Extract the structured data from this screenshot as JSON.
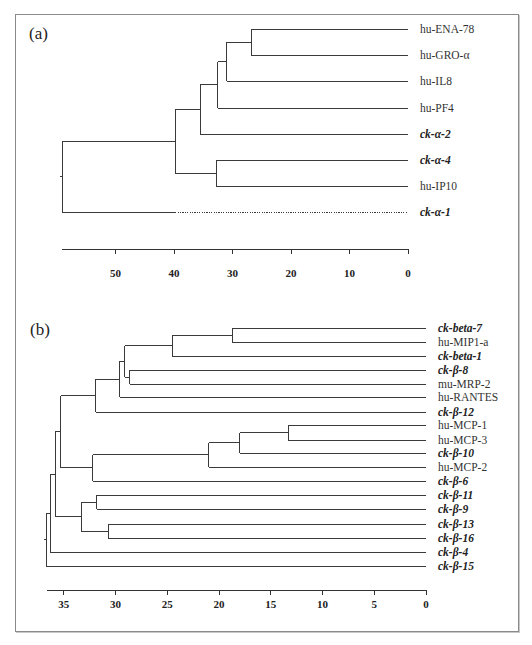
{
  "chart_data": [
    {
      "type": "dendrogram",
      "panel_label": "(a)",
      "xlabel": "",
      "axis": {
        "ticks": [
          50,
          40,
          30,
          20,
          10,
          0
        ],
        "x0_px": 408,
        "px_per_unit": 5.85,
        "y_px": 249,
        "x_start_px": 62
      },
      "leaves": [
        {
          "label": "hu-ENA-78",
          "italic": false,
          "y": 29
        },
        {
          "label": "hu-GRO-α",
          "italic": false,
          "y": 55
        },
        {
          "label": "hu-IL8",
          "italic": false,
          "y": 81
        },
        {
          "label": "hu-PF4",
          "italic": false,
          "y": 108
        },
        {
          "label": "ck-α-2",
          "italic": true,
          "y": 134
        },
        {
          "label": "ck-α-4",
          "italic": true,
          "y": 160
        },
        {
          "label": "hu-IP10",
          "italic": false,
          "y": 186
        },
        {
          "label": "ck-α-1",
          "italic": true,
          "y": 212,
          "dotted_from": 39.8
        }
      ],
      "merges": [
        {
          "id": "n1",
          "children": [
            "hu-ENA-78",
            "hu-GRO-α"
          ],
          "height": 26.8
        },
        {
          "id": "n2",
          "children": [
            "n1",
            "hu-IL8"
          ],
          "height": 31.0
        },
        {
          "id": "n3",
          "children": [
            "n2",
            "hu-PF4"
          ],
          "height": 32.5
        },
        {
          "id": "n4",
          "children": [
            "n3",
            "ck-α-2"
          ],
          "height": 35.5
        },
        {
          "id": "n5",
          "children": [
            "ck-α-4",
            "hu-IP10"
          ],
          "height": 32.8
        },
        {
          "id": "n6",
          "children": [
            "n4",
            "n5"
          ],
          "height": 39.8
        },
        {
          "id": "n7",
          "children": [
            "n6",
            "ck-α-1"
          ],
          "height": 59.1
        }
      ]
    },
    {
      "type": "dendrogram",
      "panel_label": "(b)",
      "xlabel": "",
      "axis": {
        "ticks": [
          35,
          30,
          25,
          20,
          15,
          10,
          5,
          0
        ],
        "x0_px": 426,
        "px_per_unit": 10.35,
        "y_px": 590,
        "x_start_px": 47
      },
      "leaves": [
        {
          "label": "ck-beta-7",
          "italic": true,
          "y": 328
        },
        {
          "label": "hu-MIP1-a",
          "italic": false,
          "y": 342
        },
        {
          "label": "ck-beta-1",
          "italic": true,
          "y": 356
        },
        {
          "label": "ck-β-8",
          "italic": true,
          "y": 370
        },
        {
          "label": "mu-MRP-2",
          "italic": false,
          "y": 384
        },
        {
          "label": "hu-RANTES",
          "italic": false,
          "y": 397
        },
        {
          "label": "ck-β-12",
          "italic": true,
          "y": 412
        },
        {
          "label": "hu-MCP-1",
          "italic": false,
          "y": 425
        },
        {
          "label": "hu-MCP-3",
          "italic": false,
          "y": 440
        },
        {
          "label": "ck-β-10",
          "italic": true,
          "y": 453
        },
        {
          "label": "hu-MCP-2",
          "italic": false,
          "y": 467
        },
        {
          "label": "ck-β-6",
          "italic": true,
          "y": 481
        },
        {
          "label": "ck-β-11",
          "italic": true,
          "y": 495
        },
        {
          "label": "ck-β-9",
          "italic": true,
          "y": 509
        },
        {
          "label": "ck-β-13",
          "italic": true,
          "y": 524
        },
        {
          "label": "ck-β-16",
          "italic": true,
          "y": 538
        },
        {
          "label": "ck-β-4",
          "italic": true,
          "y": 552
        },
        {
          "label": "ck-β-15",
          "italic": true,
          "y": 566
        }
      ],
      "merges": [
        {
          "id": "b1",
          "children": [
            "ck-beta-7",
            "hu-MIP1-a"
          ],
          "height": 18.7
        },
        {
          "id": "b2",
          "children": [
            "b1",
            "ck-beta-1"
          ],
          "height": 24.5
        },
        {
          "id": "b3",
          "children": [
            "ck-β-8",
            "mu-MRP-2"
          ],
          "height": 28.6
        },
        {
          "id": "b4",
          "children": [
            "b2",
            "b3"
          ],
          "height": 29.1
        },
        {
          "id": "b5",
          "children": [
            "b4",
            "hu-RANTES"
          ],
          "height": 29.6
        },
        {
          "id": "b6",
          "children": [
            "b5",
            "ck-β-12"
          ],
          "height": 31.9
        },
        {
          "id": "b7",
          "children": [
            "hu-MCP-1",
            "hu-MCP-3"
          ],
          "height": 13.3
        },
        {
          "id": "b8",
          "children": [
            "b7",
            "ck-β-10"
          ],
          "height": 18.0
        },
        {
          "id": "b9",
          "children": [
            "b8",
            "hu-MCP-2"
          ],
          "height": 21.0
        },
        {
          "id": "b10",
          "children": [
            "b9",
            "ck-β-6"
          ],
          "height": 32.2
        },
        {
          "id": "b11",
          "children": [
            "b6",
            "b10"
          ],
          "height": 35.3
        },
        {
          "id": "b12",
          "children": [
            "ck-β-11",
            "ck-β-9"
          ],
          "height": 31.8
        },
        {
          "id": "b13",
          "children": [
            "ck-β-13",
            "ck-β-16"
          ],
          "height": 30.7
        },
        {
          "id": "b14",
          "children": [
            "b12",
            "b13"
          ],
          "height": 33.3
        },
        {
          "id": "b15",
          "children": [
            "b11",
            "b14"
          ],
          "height": 35.8
        },
        {
          "id": "b16",
          "children": [
            "b15",
            "ck-β-4"
          ],
          "height": 36.3
        },
        {
          "id": "b17",
          "children": [
            "b16",
            "ck-β-15"
          ],
          "height": 36.7
        }
      ]
    }
  ]
}
